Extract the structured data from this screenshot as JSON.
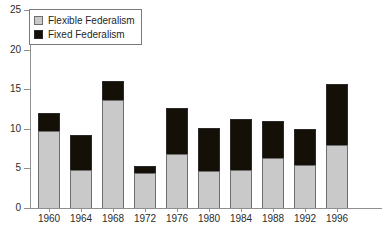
{
  "title_strip": "",
  "legend": {
    "position": "top-left",
    "items": [
      {
        "label": "Flexible Federalism",
        "color": "#c9c9c9",
        "swatch": "flex"
      },
      {
        "label": "Fixed Federalism",
        "color": "#141008",
        "swatch": "fixed"
      }
    ]
  },
  "axes": {
    "y_ticks": [
      "0",
      "5",
      "10",
      "15",
      "20",
      "25"
    ],
    "x_ticks": [
      "1960",
      "1964",
      "1968",
      "1972",
      "1976",
      "1980",
      "1984",
      "1988",
      "1992",
      "1996"
    ]
  },
  "chart_data": {
    "type": "bar",
    "stacked": true,
    "title": "",
    "xlabel": "",
    "ylabel": "",
    "ylim": [
      0,
      25
    ],
    "ytick_values": [
      0,
      5,
      10,
      15,
      20,
      25
    ],
    "grid": false,
    "legend_position": "top-left",
    "categories": [
      "1960",
      "1964",
      "1968",
      "1972",
      "1976",
      "1980",
      "1984",
      "1988",
      "1992",
      "1996"
    ],
    "series": [
      {
        "name": "Flexible Federalism",
        "color": "#c9c9c9",
        "values": [
          9.7,
          4.8,
          13.6,
          4.4,
          6.8,
          4.7,
          4.8,
          6.3,
          5.4,
          8.0
        ]
      },
      {
        "name": "Fixed Federalism",
        "color": "#141008",
        "values": [
          2.3,
          4.4,
          2.4,
          0.9,
          5.8,
          5.4,
          6.4,
          4.7,
          4.6,
          7.6
        ]
      }
    ],
    "totals": [
      12.0,
      9.2,
      16.0,
      5.3,
      12.6,
      10.1,
      11.2,
      11.0,
      10.0,
      15.6
    ]
  }
}
